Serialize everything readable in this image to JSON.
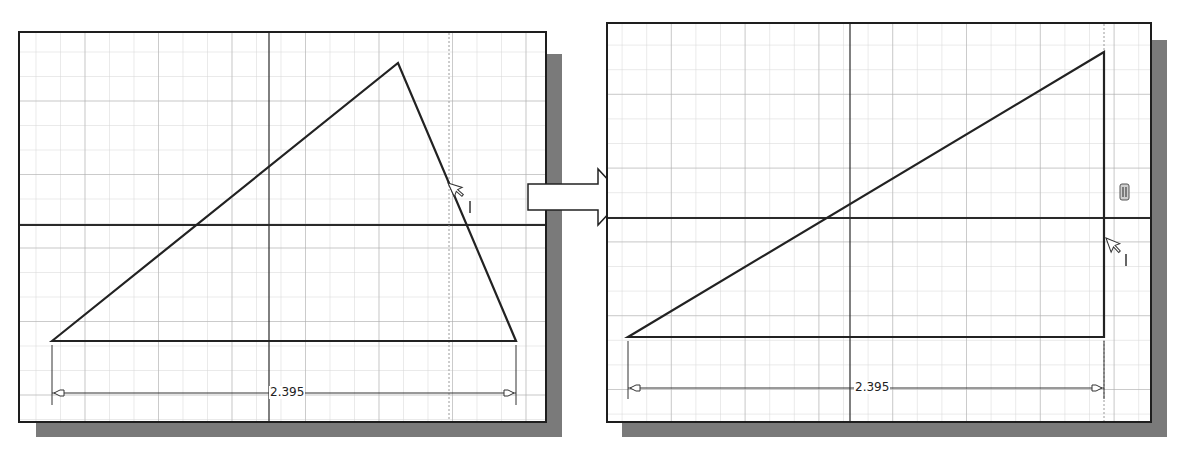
{
  "figure": {
    "colors": {
      "grid_minor": "#d4d4d4",
      "grid_major": "#a8a8a8",
      "axis": "#2a2a2a",
      "geometry": "#222222",
      "shadow": "#7a7a7a",
      "frame_border": "#1e1e1e"
    }
  },
  "left_panel": {
    "title": "before",
    "dimension": {
      "value": "2.395"
    },
    "cursor": {
      "icon": "pointer-arrow-icon",
      "glyph": "I"
    }
  },
  "transition_arrow": {
    "icon": "right-arrow-icon"
  },
  "right_panel": {
    "title": "after",
    "dimension": {
      "value": "2.395"
    },
    "constraint_badge": {
      "icon": "vertical-constraint-icon"
    },
    "cursor": {
      "icon": "pointer-arrow-icon",
      "glyph": "I"
    }
  }
}
